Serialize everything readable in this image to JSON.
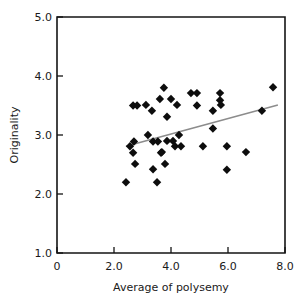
{
  "chart_data": {
    "type": "scatter",
    "title": "",
    "xlabel": "Average of polysemy",
    "ylabel": "Originality",
    "xlim": [
      0,
      8.0
    ],
    "ylim": [
      1.0,
      5.0
    ],
    "xticks": [
      "0",
      "2.0",
      "4.0",
      "6.0",
      "8.0"
    ],
    "xtick_values": [
      0,
      2.0,
      4.0,
      6.0,
      8.0
    ],
    "yticks": [
      "1.0",
      "2.0",
      "3.0",
      "4.0",
      "5.0"
    ],
    "ytick_values": [
      1.0,
      2.0,
      3.0,
      4.0,
      5.0
    ],
    "grid": false,
    "legend": "none",
    "marker": "diamond",
    "marker_color": "#0d0d0d",
    "points": [
      {
        "x": 2.42,
        "y": 2.2
      },
      {
        "x": 2.56,
        "y": 2.81
      },
      {
        "x": 2.67,
        "y": 2.7
      },
      {
        "x": 2.67,
        "y": 3.5
      },
      {
        "x": 2.7,
        "y": 2.89
      },
      {
        "x": 2.74,
        "y": 2.51
      },
      {
        "x": 2.81,
        "y": 3.5
      },
      {
        "x": 3.12,
        "y": 3.51
      },
      {
        "x": 3.19,
        "y": 3.0
      },
      {
        "x": 3.33,
        "y": 3.41
      },
      {
        "x": 3.37,
        "y": 2.89
      },
      {
        "x": 3.37,
        "y": 2.42
      },
      {
        "x": 3.51,
        "y": 2.2
      },
      {
        "x": 3.54,
        "y": 2.89
      },
      {
        "x": 3.61,
        "y": 3.61
      },
      {
        "x": 3.65,
        "y": 2.7
      },
      {
        "x": 3.68,
        "y": 2.71
      },
      {
        "x": 3.75,
        "y": 3.8
      },
      {
        "x": 3.79,
        "y": 2.51
      },
      {
        "x": 3.86,
        "y": 3.31
      },
      {
        "x": 3.86,
        "y": 2.9
      },
      {
        "x": 4.0,
        "y": 3.61
      },
      {
        "x": 4.07,
        "y": 2.9
      },
      {
        "x": 4.14,
        "y": 2.81
      },
      {
        "x": 4.21,
        "y": 3.51
      },
      {
        "x": 4.28,
        "y": 3.0
      },
      {
        "x": 4.35,
        "y": 2.81
      },
      {
        "x": 4.7,
        "y": 3.71
      },
      {
        "x": 4.91,
        "y": 3.71
      },
      {
        "x": 4.91,
        "y": 3.5
      },
      {
        "x": 5.12,
        "y": 2.81
      },
      {
        "x": 5.47,
        "y": 3.41
      },
      {
        "x": 5.47,
        "y": 3.11
      },
      {
        "x": 5.72,
        "y": 3.71
      },
      {
        "x": 5.72,
        "y": 3.59
      },
      {
        "x": 5.75,
        "y": 3.51
      },
      {
        "x": 5.96,
        "y": 2.81
      },
      {
        "x": 5.96,
        "y": 2.41
      },
      {
        "x": 6.63,
        "y": 2.71
      },
      {
        "x": 7.19,
        "y": 3.41
      },
      {
        "x": 7.58,
        "y": 3.81
      }
    ],
    "trendline": {
      "type": "linear-fit",
      "color": "#8c8c8c",
      "x_start": 2.42,
      "y_start": 2.81,
      "x_end": 7.75,
      "y_end": 3.51
    }
  }
}
